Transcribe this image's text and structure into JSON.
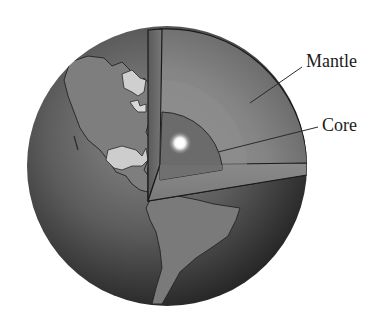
{
  "diagram": {
    "labels": {
      "mantle": "Mantle",
      "core": "Core"
    },
    "colors": {
      "background": "#ffffff",
      "globe_dark": "#2b2b2b",
      "globe_mid": "#6a6a6a",
      "land": "#7a7a7a",
      "land_light": "#c8c8c8",
      "mantle": "#7d7d7d",
      "outer_core_band": "#8e8e8e",
      "core": "#6b6b6b",
      "core_hot_spot": "#ffffff",
      "outline": "#1a1a1a",
      "text": "#1a1a1a"
    }
  }
}
